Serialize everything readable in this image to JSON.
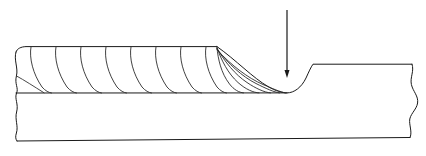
{
  "figure": {
    "title": "Weld bead run-out cross-section",
    "background_color": "#ffffff",
    "line_color": "#1a1a1a",
    "ripple_color": "#2b2b2b",
    "canvas": {
      "width": 426,
      "height": 156
    }
  },
  "annotations": {
    "arrow": {
      "name": "crater-pointer-arrow",
      "label": "",
      "x": 287,
      "y_start": 10,
      "y_end": 78,
      "direction": "down",
      "head_width": 5,
      "head_height": 8
    }
  },
  "geometry": {
    "bead_top_y": 47,
    "interface_y": 93,
    "base_bottom_y_left": 141,
    "base_bottom_y_right": 137,
    "bead_end_x": 217,
    "crater_bottom_x": 287,
    "plateau_start_x": 313,
    "plateau_y": 64,
    "break_line_left_x": 16,
    "break_line_right_x": 412
  },
  "paths": {
    "bead_top_surface": "M 16 52 C 17 48.5 21 46.8 26 46.6 L 217 46.6",
    "bead_runout_profile": "M 217 46.6 C 236 60 253 78 268 86.5 C 276 91.2 282.5 92.8 287 92.9 C 294 92.9 301.5 87.5 306 78 C 308.6 72.4 310.8 67.2 313 64.2 L 412 64.2",
    "interface_line": "M 16 93 L 287 92.9",
    "base_bottom": "M 17 141 L 410 137.5",
    "break_line_left": "M 16 52 C 13.5 60 18.5 68 16.4 76 C 14.4 84 18.8 88 16.6 93 C 14.2 98.6 18.8 104 16.6 112 C 14.6 119.5 18.6 126 16.4 133 C 15.2 136.8 15.6 139.3 17 141",
    "break_line_right": "M 412 64.2 C 414.5 71 409.8 77.5 411.4 84.5 C 413 91.5 418.6 96 417.6 103 C 416.6 110 409.2 114.5 409.6 121.5 C 409.9 127.5 412.2 133 410 137.5"
  },
  "ripples": {
    "count": 13,
    "note": "Crescent ripple lines of the deposited weld bead; each arcs from the bead top surface down to the bead/base interface, leaning toward the run-out direction.",
    "paths": [
      "M 31 46.9 C 29 58 33 74 42 87 C 45.5 91 48.8 92.6 51.5 93",
      "M 56 46.8 C 54 58 58 74 67 87 C 70.5 91 73.8 92.6 76.5 93",
      "M 81 46.8 C 79 58 83 74 92 87 C 95.5 91 98.8 92.6 101.5 93",
      "M 106 46.8 C 104 58 108 74 117 87 C 120.5 91 123.8 92.6 126.5 93",
      "M 131 46.8 C 129 58 133 74 142 87 C 145.5 91 148.8 92.6 151.5 93",
      "M 156 46.8 C 154 58 158 74 167 87 C 170.5 91 173.8 92.6 176.5 93",
      "M 181 46.8 C 179 58 183 74 192 87 C 195.5 91 198.8 92.6 201.5 93",
      "M 206 46.8 C 204 58 208 74 217 87 C 220.5 91 223.8 92.6 226.5 93",
      "M 217 47.4 C 218 59 221 73 229.5 84 C 234 89.8 239 92.5 243.5 92.9",
      "M 217 47.8 C 221.5 60.5 228 73.5 238 82.5 C 246 89.6 253.5 92.6 259 92.9",
      "M 217 48.4 C 225 62 235 74.5 247 82.5 C 256 88.6 264.5 92.4 270.5 92.9",
      "M 217 49 C 228.5 64 242 76.5 256 83.5 C 265.5 88.3 274 92.2 279.5 92.9",
      "M 217 49.8 C 232 66 248 78 263 84.5 C 272 88.4 280.5 92.1 285.5 92.9"
    ]
  },
  "left_edge_detail": {
    "note": "Short chamfer arc at the left break showing the start edge of the deposited layer.",
    "path": "M 16.6 76 C 24 80 34 86.5 44 92.8"
  }
}
